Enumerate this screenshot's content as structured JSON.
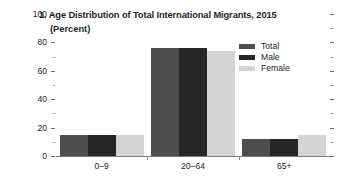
{
  "chart_data": {
    "type": "bar",
    "title": "1. Age Distribution of Total International Migrants, 2015",
    "subtitle": "(Percent)",
    "xlabel": "",
    "ylabel": "",
    "categories": [
      "0–9",
      "20–64",
      "65+"
    ],
    "series": [
      {
        "name": "Total",
        "color": "#4d4d4d",
        "values": [
          15,
          76,
          12
        ]
      },
      {
        "name": "Male",
        "color": "#262626",
        "values": [
          15,
          76,
          12
        ]
      },
      {
        "name": "Female",
        "color": "#d4d4d4",
        "values": [
          15,
          74,
          15
        ]
      }
    ],
    "ylim": [
      0,
      100
    ],
    "ytick_labels": [
      "0",
      "20",
      "40",
      "60",
      "80",
      "100"
    ],
    "ytick_values": [
      0,
      20,
      40,
      60,
      80,
      100
    ],
    "yminor_values": [
      10,
      30,
      50,
      70,
      90
    ],
    "grid": false,
    "legend_position": "top-right"
  },
  "legend": {
    "items": [
      {
        "label": "Total"
      },
      {
        "label": "Male"
      },
      {
        "label": "Female"
      }
    ]
  }
}
